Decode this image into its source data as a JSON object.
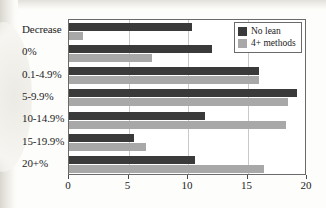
{
  "chart_data": {
    "type": "bar",
    "orientation": "horizontal",
    "title": "",
    "subtitle": "",
    "xlabel": "",
    "ylabel": "",
    "xlim": [
      0,
      20
    ],
    "xticks": [
      0,
      5,
      10,
      15,
      20
    ],
    "xtick_labels": [
      "0",
      "5",
      "10",
      "15",
      "20"
    ],
    "grid": true,
    "grid_axis": "x",
    "legend_position": "top-right-inside",
    "categories": [
      "Decrease",
      "0%",
      "0.1-4.9%",
      "5-9.9%",
      "10-14.9%",
      "15-19.9%",
      "20+%"
    ],
    "series": [
      {
        "name": "No lean",
        "color": "#3a3a3a",
        "values": [
          10.3,
          12.0,
          16.0,
          19.2,
          11.4,
          5.5,
          10.6
        ]
      },
      {
        "name": "4+ methods",
        "color": "#a8a8a8",
        "values": [
          1.2,
          7.0,
          16.0,
          18.4,
          18.2,
          6.5,
          16.4
        ]
      }
    ]
  },
  "legend": {
    "items": [
      {
        "label": "No lean",
        "color": "#3a3a3a"
      },
      {
        "label": "4+ methods",
        "color": "#a8a8a8"
      }
    ]
  },
  "colors": {
    "series_dark": "#3a3a3a",
    "series_light": "#a8a8a8",
    "axis": "#6a6a6a",
    "gridline": "#c9c9c9",
    "text": "#1c1c1c",
    "page_background": "#fdfdfb",
    "plot_background": "#ffffff"
  }
}
